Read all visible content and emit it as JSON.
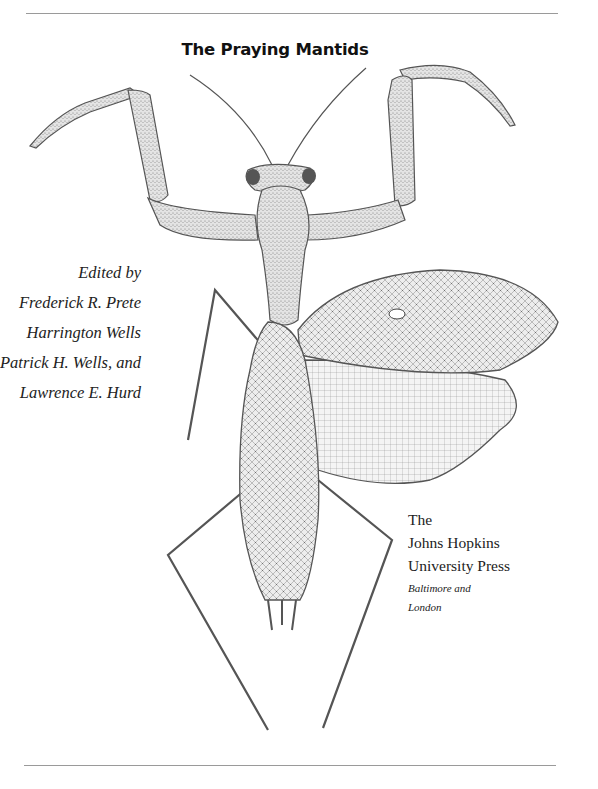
{
  "page": {
    "type": "book title page",
    "background": "#ffffff",
    "ink_color": "#222222",
    "rule_color": "#9a9a9a"
  },
  "title": "The Praying Mantids",
  "editors": {
    "lines": [
      "Edited by",
      "Frederick R. Prete",
      "Harrington Wells",
      "Patrick H. Wells, and",
      "Lawrence E. Hurd"
    ]
  },
  "publisher": {
    "lines": [
      "The",
      "Johns Hopkins",
      "University Press"
    ],
    "cities": [
      "Baltimore and",
      "London"
    ]
  },
  "illustration": {
    "subject": "praying mantis, dorsal view, wings spread on right side",
    "style": "stipple and line engraving"
  }
}
